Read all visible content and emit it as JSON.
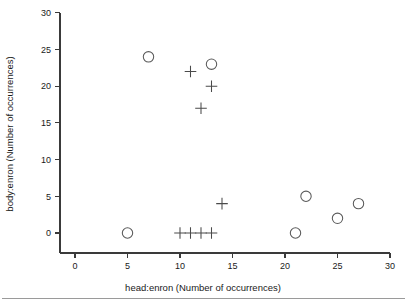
{
  "chart_data": {
    "type": "scatter",
    "title": "",
    "xlabel": "head:enron (Number of occurrences)",
    "ylabel": "body:enron (Number of occurrences)",
    "xlim": [
      0,
      30
    ],
    "ylim": [
      0,
      30
    ],
    "xticks": [
      0,
      5,
      10,
      15,
      20,
      25,
      30
    ],
    "yticks": [
      0,
      5,
      10,
      15,
      20,
      25,
      30
    ],
    "xtick_labels": [
      "0",
      "5",
      "10",
      "15",
      "20",
      "25",
      "30"
    ],
    "ytick_labels": [
      "0",
      "5",
      "10",
      "15",
      "20",
      "25",
      "30"
    ],
    "grid": false,
    "legend": null,
    "series": [
      {
        "name": "circle-series",
        "marker": "circle",
        "color": "#5a5a5a",
        "points": [
          {
            "x": 7,
            "y": 24
          },
          {
            "x": 13,
            "y": 23
          },
          {
            "x": 5,
            "y": 0
          },
          {
            "x": 21,
            "y": 0
          },
          {
            "x": 22,
            "y": 5
          },
          {
            "x": 25,
            "y": 2
          },
          {
            "x": 27,
            "y": 4
          }
        ]
      },
      {
        "name": "plus-series",
        "marker": "plus",
        "color": "#4a4a4a",
        "points": [
          {
            "x": 11,
            "y": 22
          },
          {
            "x": 13,
            "y": 20
          },
          {
            "x": 12,
            "y": 17
          },
          {
            "x": 14,
            "y": 4
          },
          {
            "x": 10,
            "y": 0
          },
          {
            "x": 11,
            "y": 0
          },
          {
            "x": 12,
            "y": 0
          },
          {
            "x": 13,
            "y": 0
          }
        ]
      }
    ]
  },
  "figure": {
    "background_color": "#ffffff",
    "axis_color": "#3a3a3a",
    "footer_rule_color": "#9a9a9a"
  }
}
